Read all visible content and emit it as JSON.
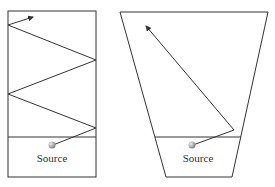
{
  "diagrams": [
    {
      "name": "rectangular-light-pipe",
      "source_label": "Source",
      "shape": "rectangle",
      "description": "Ray from source zigzags via multiple reflections off parallel walls"
    },
    {
      "name": "tapered-light-pipe",
      "source_label": "Source",
      "shape": "trapezoid",
      "description": "Ray from source reflects once off the tapered wall and exits upward"
    }
  ],
  "colors": {
    "line": "#333333",
    "source_ball": "#9a9a9a",
    "background": "#ffffff"
  }
}
